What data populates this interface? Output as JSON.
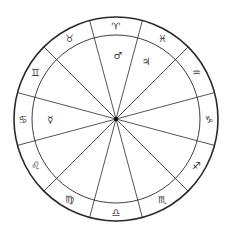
{
  "wheel": {
    "center": [
      116,
      119
    ],
    "outer_radius": 102,
    "inner_radius": 84,
    "hub_radius": 2.2,
    "line_color": "#2a2a2a",
    "outer_stroke_width": 1.6,
    "inner_stroke_width": 0.9,
    "spoke_stroke_width": 0.8,
    "first_boundary_deg": -75,
    "sector_span_deg": 30
  },
  "signs": [
    {
      "name": "Aries",
      "glyph": "♈",
      "center_deg": -90
    },
    {
      "name": "Pisces",
      "glyph": "♓",
      "center_deg": -60
    },
    {
      "name": "Aquarius",
      "glyph": "♒",
      "center_deg": -30
    },
    {
      "name": "Capricorn",
      "glyph": "♑",
      "center_deg": 0
    },
    {
      "name": "Sagittarius",
      "glyph": "♐",
      "center_deg": 30
    },
    {
      "name": "Scorpio",
      "glyph": "♏",
      "center_deg": 60
    },
    {
      "name": "Libra",
      "glyph": "♎",
      "center_deg": 90
    },
    {
      "name": "Virgo",
      "glyph": "♍",
      "center_deg": 120
    },
    {
      "name": "Leo",
      "glyph": "♌",
      "center_deg": 150
    },
    {
      "name": "Cancer",
      "glyph": "♋",
      "center_deg": 180
    },
    {
      "name": "Gemini",
      "glyph": "♊",
      "center_deg": 210
    },
    {
      "name": "Taurus",
      "glyph": "♉",
      "center_deg": 240
    }
  ],
  "planets": [
    {
      "name": "Mars",
      "glyph": "♂",
      "x": 118,
      "y": 55
    },
    {
      "name": "Jupiter",
      "glyph": "♃",
      "x": 146,
      "y": 61
    },
    {
      "name": "Mercury",
      "glyph": "☿",
      "x": 50,
      "y": 119
    }
  ]
}
